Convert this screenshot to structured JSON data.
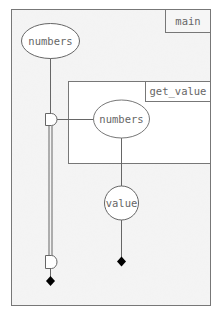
{
  "diagram": {
    "scopes": [
      {
        "id": "main",
        "label": "main"
      },
      {
        "id": "get_value",
        "label": "get_value"
      }
    ],
    "nodes": [
      {
        "id": "main-numbers",
        "label": "numbers",
        "shape": "ellipse",
        "scope": "main"
      },
      {
        "id": "getvalue-numbers",
        "label": "numbers",
        "shape": "ellipse",
        "scope": "get_value"
      },
      {
        "id": "value",
        "label": "value",
        "shape": "circle",
        "scope": "main"
      }
    ],
    "connectors": [
      {
        "id": "borrow-start",
        "shape": "d-shape"
      },
      {
        "id": "borrow-end",
        "shape": "d-shape"
      }
    ],
    "terminals": [
      {
        "id": "numbers-drop",
        "shape": "diamond"
      },
      {
        "id": "value-drop",
        "shape": "diamond"
      }
    ],
    "colors": {
      "outer_fill": "#f2f2f2",
      "inner_fill": "#ffffff",
      "stroke": "#777777",
      "text": "#666666",
      "diamond": "#000000"
    }
  }
}
